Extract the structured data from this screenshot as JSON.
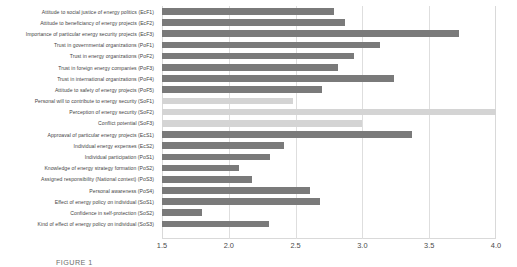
{
  "chart_data": {
    "type": "bar",
    "orientation": "horizontal",
    "title": "",
    "xlabel": "",
    "ylabel": "",
    "xlim": [
      1.5,
      4.0
    ],
    "xticks": [
      "1.5",
      "2.0",
      "2.5",
      "3.0",
      "3.5",
      "4.0"
    ],
    "xtick_values": [
      1.5,
      2.0,
      2.5,
      3.0,
      3.5,
      4.0
    ],
    "grid": true,
    "legend": "none",
    "colors": {
      "dark_bar": "#7a7a7a",
      "light_bar": "#d4d4d4",
      "gridline": "#dedede",
      "axis": "#d9d9d9",
      "label_text": "#444444"
    },
    "categories": [
      "Attitude to social justice of energy politics (EcF1)",
      "Attitude to beneficiancy of energy projects  (EcF2)",
      "Importance of particular energy security projects  (EcF3)",
      "Trust in governmental organizations (PoF1)",
      "Trust in energy organizations (PoF2)",
      "Trust in foreign energy companies (PoF3)",
      "Trust in international organizations (PoF4)",
      "Attitude to safety of energy projects (PoF5)",
      "Personal will to contribute to energy security (SoF1)",
      "Perception of energy security (SoF2)",
      "Conflict potential (SoF3)",
      "Approaval of particular energy projects (EcS1)",
      "Individual energy expenses (EcS2)",
      "Individual participation (PoS1)",
      "Knowledge of energy strategy formation (PoS2)",
      "Assigned responsibility (National context) (PoS3)",
      "Personal awareness (PoS4)",
      "Effect of energy policy on individual (SoS1)",
      "Confidence in self-protection (SoS2)",
      "Kind of effect of energy policy on individual (SoS3)"
    ],
    "values": [
      2.79,
      2.87,
      3.72,
      3.13,
      2.94,
      2.82,
      3.24,
      2.7,
      2.48,
      4.0,
      3.0,
      3.37,
      2.41,
      2.31,
      2.08,
      2.17,
      2.61,
      2.68,
      1.8,
      2.3
    ],
    "shades": [
      "dark",
      "dark",
      "dark",
      "dark",
      "dark",
      "dark",
      "dark",
      "dark",
      "light",
      "light",
      "light",
      "dark",
      "dark",
      "dark",
      "dark",
      "dark",
      "dark",
      "dark",
      "dark",
      "dark"
    ]
  },
  "caption": {
    "text": "FIGURE 1"
  }
}
